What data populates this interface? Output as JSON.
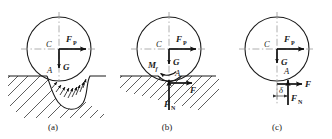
{
  "figure": {
    "background_color": "#ffffff",
    "line_color": "#1a1a1a",
    "axis_color": "#9a9a9a",
    "panels": [
      {
        "id": "a",
        "caption": "(a)",
        "description": "Wheel on deformable ground with distributed contact pressure",
        "labels": {
          "center": "C",
          "contact": "A",
          "weight": "G",
          "applied_force": "F",
          "applied_force_sub": "P"
        }
      },
      {
        "id": "b",
        "caption": "(b)",
        "description": "Wheel with resultant normal force, friction force and rolling resistance couple",
        "labels": {
          "center": "C",
          "contact": "A",
          "weight": "G",
          "applied_force": "F",
          "applied_force_sub": "P",
          "friction": "F",
          "normal_force": "F",
          "normal_force_sub": "N",
          "moment": "M",
          "moment_sub": "f"
        }
      },
      {
        "id": "c",
        "caption": "(c)",
        "description": "Wheel with normal force offset by distance delta from contact point",
        "labels": {
          "center": "C",
          "contact": "A",
          "weight": "G",
          "applied_force": "F",
          "applied_force_sub": "P",
          "friction": "F",
          "normal_force": "F",
          "normal_force_sub": "N",
          "offset": "δ"
        }
      }
    ]
  }
}
